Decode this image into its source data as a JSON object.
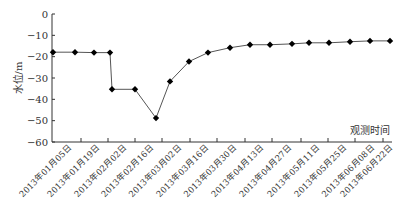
{
  "chart_data": {
    "type": "line",
    "title": "",
    "xlabel": "观测时间",
    "ylabel": "水位/m",
    "ylim": [
      -60,
      0
    ],
    "yticks": [
      0,
      -10,
      -20,
      -30,
      -40,
      -50,
      -60
    ],
    "grid": false,
    "legend": null,
    "categories": [
      "2013年01月05日",
      "2013年01月19日",
      "2013年02月02日",
      "2013年02月16日",
      "2013年03月02日",
      "2013年03月16日",
      "2013年03月30日",
      "2013年04月13日",
      "2013年04月27日",
      "2013年05月11日",
      "2013年05月25日",
      "2013年06月08日",
      "2013年06月22日"
    ],
    "series": [
      {
        "name": "水位",
        "marker": "diamond",
        "color": "#000000",
        "line_color": "#555555",
        "points": [
          {
            "x": 53,
            "y": -17.9
          },
          {
            "x": 75,
            "y": -17.9
          },
          {
            "x": 94,
            "y": -18.1
          },
          {
            "x": 110,
            "y": -18.1
          },
          {
            "x": 112,
            "y": -35.3
          },
          {
            "x": 135,
            "y": -35.3
          },
          {
            "x": 156,
            "y": -48.8
          },
          {
            "x": 170,
            "y": -31.6
          },
          {
            "x": 189,
            "y": -22.3
          },
          {
            "x": 208,
            "y": -18.1
          },
          {
            "x": 230,
            "y": -15.8
          },
          {
            "x": 250,
            "y": -14.4
          },
          {
            "x": 270,
            "y": -14.4
          },
          {
            "x": 292,
            "y": -14.0
          },
          {
            "x": 309,
            "y": -13.5
          },
          {
            "x": 329,
            "y": -13.5
          },
          {
            "x": 350,
            "y": -13.0
          },
          {
            "x": 370,
            "y": -12.6
          },
          {
            "x": 390,
            "y": -12.6
          }
        ]
      }
    ],
    "layout": {
      "plot_left": 52,
      "plot_right": 392,
      "plot_top": 14,
      "plot_bottom": 142,
      "xticks_px": [
        81,
        108,
        135,
        162,
        190,
        217,
        245,
        272,
        301,
        328,
        355,
        383
      ]
    }
  }
}
